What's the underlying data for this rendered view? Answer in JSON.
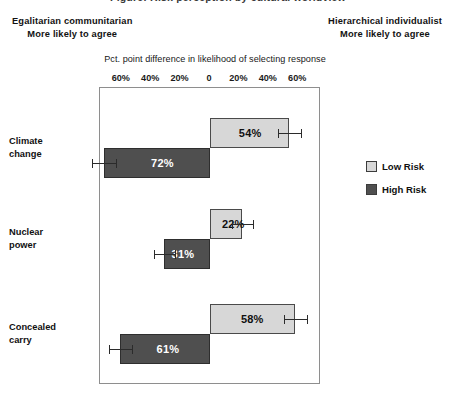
{
  "clipped_title": "Figure: Risk perception by cultural worldview",
  "headers": {
    "left_line1": "Egalitarian communitarian",
    "left_line2": "More likely to agree",
    "right_line1": "Hierarchical individualist",
    "right_line2": "More likely to agree"
  },
  "legend": {
    "low_label": "Low Risk",
    "high_label": "High Risk"
  },
  "colors": {
    "low_risk": "#d7d7d7",
    "high_risk": "#4f4f4f",
    "frame": "#8e8e8e",
    "error_bar": "#2b2b2b"
  },
  "chart_data": {
    "type": "bar",
    "orientation": "horizontal",
    "title": "",
    "xlabel": "Pct. point difference in likelihood of selecting response",
    "ylabel": "",
    "xlim": [
      -75,
      75
    ],
    "grid": false,
    "legend_position": "right",
    "tick_labels": [
      "60%",
      "40%",
      "20%",
      "0",
      "20%",
      "40%",
      "60%"
    ],
    "tick_values": [
      -60,
      -40,
      -20,
      0,
      20,
      40,
      60
    ],
    "categories": [
      "Climate change",
      "Nuclear power",
      "Concealed carry"
    ],
    "category_lines": [
      [
        "Climate",
        "change"
      ],
      [
        "Nuclear",
        "power"
      ],
      [
        "Concealed",
        "carry"
      ]
    ],
    "series": [
      {
        "name": "Low Risk",
        "direction": "right",
        "values": [
          54,
          22,
          58
        ],
        "labels": [
          "54%",
          "22%",
          "58%"
        ],
        "error_low": [
          46,
          15,
          50
        ],
        "error_high": [
          62,
          29,
          66
        ]
      },
      {
        "name": "High Risk",
        "direction": "left",
        "values": [
          72,
          31,
          61
        ],
        "labels": [
          "72%",
          "31%",
          "61%"
        ],
        "error_low": [
          64,
          24,
          53
        ],
        "error_high": [
          80,
          38,
          69
        ]
      }
    ]
  }
}
